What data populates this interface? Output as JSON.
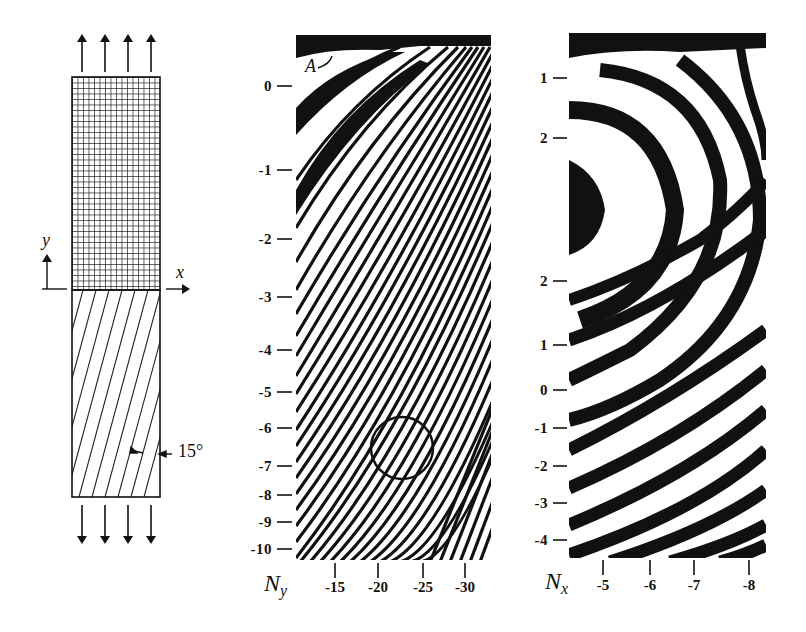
{
  "specimen": {
    "grid_label": "grating",
    "x_axis_label": "x",
    "y_axis_label": "y",
    "fiber_angle_label": "15°",
    "fiber_angle_deg": 15,
    "load_arrows_top": 4,
    "load_arrows_bottom": 4
  },
  "ny_panel": {
    "axis_name": "N",
    "axis_sub": "y",
    "point_label": "A",
    "y_ticks": [
      {
        "label": "0",
        "y": 86
      },
      {
        "label": "-1",
        "y": 170
      },
      {
        "label": "-2",
        "y": 239
      },
      {
        "label": "-3",
        "y": 297
      },
      {
        "label": "-4",
        "y": 350
      },
      {
        "label": "-5",
        "y": 392
      },
      {
        "label": "-6",
        "y": 428
      },
      {
        "label": "-7",
        "y": 466
      },
      {
        "label": "-8",
        "y": 495
      },
      {
        "label": "-9",
        "y": 522
      },
      {
        "label": "-10",
        "y": 549
      }
    ],
    "x_ticks": [
      {
        "label": "-15",
        "x": 335
      },
      {
        "label": "-20",
        "x": 378
      },
      {
        "label": "-25",
        "x": 423
      },
      {
        "label": "-30",
        "x": 465
      }
    ],
    "marker": "circle"
  },
  "nx_panel": {
    "axis_name": "N",
    "axis_sub": "x",
    "y_ticks": [
      {
        "label": "1",
        "y": 78
      },
      {
        "label": "2",
        "y": 138
      },
      {
        "label": "2",
        "y": 281
      },
      {
        "label": "1",
        "y": 345
      },
      {
        "label": "0",
        "y": 390
      },
      {
        "label": "-1",
        "y": 428
      },
      {
        "label": "-2",
        "y": 466
      },
      {
        "label": "-3",
        "y": 503
      },
      {
        "label": "-4",
        "y": 540
      }
    ],
    "x_ticks": [
      {
        "label": "-5",
        "x": 603
      },
      {
        "label": "-6",
        "x": 650
      },
      {
        "label": "-7",
        "x": 694
      },
      {
        "label": "-8",
        "x": 749
      }
    ]
  },
  "colors": {
    "ink": "#111111",
    "paper": "#ffffff"
  }
}
